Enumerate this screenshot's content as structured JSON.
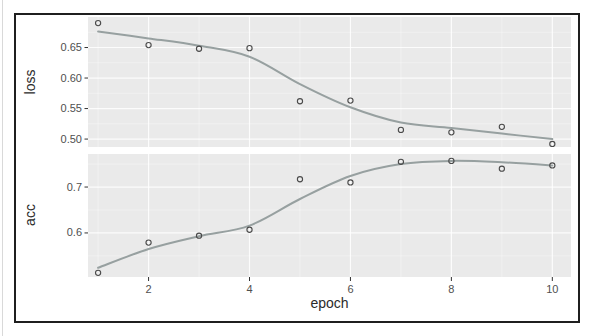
{
  "chart_data": {
    "type": "scatter",
    "xlabel": "epoch",
    "x": [
      1,
      2,
      3,
      4,
      5,
      6,
      7,
      8,
      9,
      10
    ],
    "xticks": [
      {
        "value": 2,
        "label": "2"
      },
      {
        "value": 4,
        "label": "4"
      },
      {
        "value": 6,
        "label": "6"
      },
      {
        "value": 8,
        "label": "8"
      },
      {
        "value": 10,
        "label": "10"
      }
    ],
    "minor_xticks": [
      1,
      3,
      5,
      7,
      9
    ],
    "xlim": [
      0.8,
      10.37
    ],
    "legend": "none",
    "grid": "major and minor, white on gray panel",
    "panels": [
      {
        "ylabel": "loss",
        "ylim": [
          0.487,
          0.7
        ],
        "yticks": [
          {
            "value": 0.65,
            "label": "0.65"
          },
          {
            "value": 0.6,
            "label": "0.60"
          },
          {
            "value": 0.55,
            "label": "0.55"
          },
          {
            "value": 0.5,
            "label": "0.50"
          }
        ],
        "minor_yticks": [
          0.675,
          0.625,
          0.575,
          0.525
        ],
        "points": [
          0.69,
          0.654,
          0.648,
          0.649,
          0.562,
          0.563,
          0.515,
          0.511,
          0.52,
          0.492
        ],
        "smooth": [
          0.676,
          0.665,
          0.653,
          0.635,
          0.59,
          0.552,
          0.527,
          0.518,
          0.509,
          0.5
        ]
      },
      {
        "ylabel": "acc",
        "ylim": [
          0.504,
          0.772
        ],
        "yticks": [
          {
            "value": 0.7,
            "label": "0.7"
          },
          {
            "value": 0.6,
            "label": "0.6"
          }
        ],
        "minor_yticks": [
          0.75,
          0.65,
          0.55
        ],
        "points": [
          0.513,
          0.579,
          0.594,
          0.607,
          0.717,
          0.71,
          0.755,
          0.757,
          0.74,
          0.747
        ],
        "smooth": [
          0.524,
          0.565,
          0.593,
          0.616,
          0.674,
          0.724,
          0.75,
          0.757,
          0.754,
          0.747
        ]
      }
    ],
    "colors": {
      "panel_background": "#eaeaea",
      "grid_major": "rgba(255,255,255,0.85)",
      "grid_minor": "rgba(255,255,255,0.5)",
      "smooth_line": "#97a0a0",
      "point_stroke": "#4a4a4a",
      "tick_mark": "#333333",
      "tick_label": "#4f4f4f",
      "axis_title": "#2b2b2b",
      "frame_border": "#1f1f1f"
    }
  }
}
